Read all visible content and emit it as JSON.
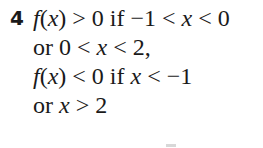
{
  "exercise": {
    "number": "4",
    "lines": [
      "f(x) > 0 if −1 < x < 0",
      "or 0 < x < 2,",
      "f(x) < 0 if x < −1",
      "or x > 2"
    ]
  }
}
